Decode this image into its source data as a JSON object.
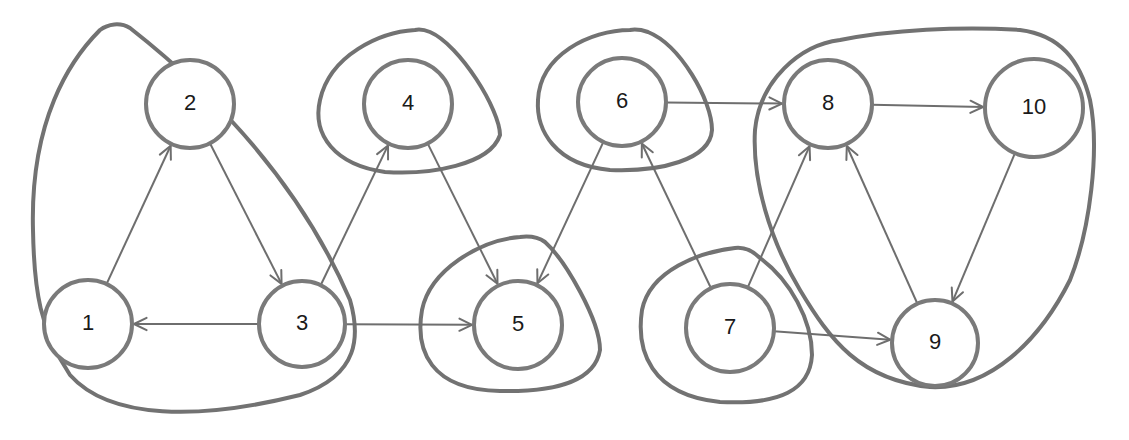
{
  "diagram": {
    "type": "directed-graph",
    "colors": {
      "node_stroke": "#7a7a7a",
      "edge_stroke": "#6e6e6e",
      "outline_stroke": "#727272",
      "background": "#ffffff"
    },
    "nodes": [
      {
        "id": "1",
        "label": "1",
        "cx": 88,
        "cy": 324,
        "r": 44
      },
      {
        "id": "2",
        "label": "2",
        "cx": 190,
        "cy": 104,
        "r": 44
      },
      {
        "id": "3",
        "label": "3",
        "cx": 302,
        "cy": 324,
        "r": 43
      },
      {
        "id": "4",
        "label": "4",
        "cx": 408,
        "cy": 104,
        "r": 44
      },
      {
        "id": "5",
        "label": "5",
        "cx": 518,
        "cy": 325,
        "r": 44
      },
      {
        "id": "6",
        "label": "6",
        "cx": 622,
        "cy": 102,
        "r": 44
      },
      {
        "id": "7",
        "label": "7",
        "cx": 730,
        "cy": 328,
        "r": 44
      },
      {
        "id": "8",
        "label": "8",
        "cx": 828,
        "cy": 104,
        "r": 44
      },
      {
        "id": "9",
        "label": "9",
        "cx": 935,
        "cy": 343,
        "r": 43
      },
      {
        "id": "10",
        "label": "10",
        "cx": 1034,
        "cy": 108,
        "r": 49
      }
    ],
    "edges": [
      {
        "from": "1",
        "to": "2"
      },
      {
        "from": "2",
        "to": "3"
      },
      {
        "from": "3",
        "to": "1"
      },
      {
        "from": "3",
        "to": "4"
      },
      {
        "from": "3",
        "to": "5"
      },
      {
        "from": "4",
        "to": "5"
      },
      {
        "from": "6",
        "to": "5"
      },
      {
        "from": "7",
        "to": "6"
      },
      {
        "from": "6",
        "to": "8"
      },
      {
        "from": "7",
        "to": "8"
      },
      {
        "from": "7",
        "to": "9"
      },
      {
        "from": "8",
        "to": "10"
      },
      {
        "from": "10",
        "to": "9"
      },
      {
        "from": "9",
        "to": "8"
      }
    ],
    "components": [
      {
        "name": "scc-1-2-3",
        "members": [
          "1",
          "2",
          "3"
        ]
      },
      {
        "name": "scc-4",
        "members": [
          "4"
        ]
      },
      {
        "name": "scc-5",
        "members": [
          "5"
        ]
      },
      {
        "name": "scc-6",
        "members": [
          "6"
        ]
      },
      {
        "name": "scc-7",
        "members": [
          "7"
        ]
      },
      {
        "name": "scc-8-9-10",
        "members": [
          "8",
          "9",
          "10"
        ]
      }
    ]
  }
}
